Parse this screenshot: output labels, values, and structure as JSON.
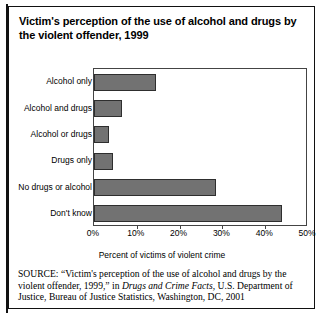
{
  "figure": {
    "title": "Victim's perception of the use of alcohol and drugs by the violent offender, 1999"
  },
  "chart_data": {
    "type": "bar",
    "orientation": "horizontal",
    "title": "Victim's perception of the use of alcohol and drugs by the violent offender, 1999",
    "categories": [
      "Alcohol only",
      "Alcohol and drugs",
      "Alcohol or drugs",
      "Drugs only",
      "No drugs or alcohol",
      "Don't know"
    ],
    "values": [
      14.5,
      6.5,
      3.5,
      4.5,
      28.5,
      44.0
    ],
    "xlabel": "Percent of victims of violent crime",
    "ylabel": "",
    "xlim": [
      0,
      50
    ],
    "xticks": [
      0,
      10,
      20,
      30,
      40,
      50
    ],
    "xticklabels": [
      "0%",
      "10%",
      "20%",
      "30%",
      "40%",
      "50%"
    ],
    "grid": false,
    "legend": null,
    "bar_color": "#727272",
    "bar_edge_color": "#2e2e2e"
  },
  "source": {
    "keyword": "SOURCE:",
    "part1": " “Victim's perception of the use of alcohol and drugs by the violent offender, 1999,” in ",
    "italic": "Drugs and Crime Facts",
    "part2": ", U.S. Department of Justice, Bureau of Justice Statistics, Washington, DC, 2001"
  }
}
